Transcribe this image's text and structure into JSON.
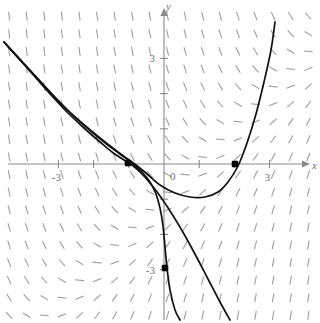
{
  "figure": {
    "title": "",
    "background_color": "#ffffff",
    "width": 320,
    "height": 323
  },
  "axes": {
    "x_label": "x",
    "y_label": "y",
    "origin_label": "0",
    "x_ticks": [
      {
        "value": -3,
        "label": "-3"
      },
      {
        "value": -2,
        "label": ""
      },
      {
        "value": -1,
        "label": ""
      },
      {
        "value": 1,
        "label": ""
      },
      {
        "value": 2,
        "label": ""
      },
      {
        "value": 3,
        "label": "3"
      }
    ],
    "y_ticks": [
      {
        "value": 3,
        "label": "3"
      },
      {
        "value": 2,
        "label": ""
      },
      {
        "value": 1,
        "label": ""
      },
      {
        "value": -1,
        "label": ""
      },
      {
        "value": -2,
        "label": ""
      },
      {
        "value": -3,
        "label": "-3"
      }
    ],
    "axis_color": "#8a8a8a",
    "tick_label_color": "#6f6f6f"
  },
  "chart_data": {
    "type": "line",
    "title": "",
    "xlabel": "x",
    "ylabel": "y",
    "xlim": [
      -4.65,
      4.45
    ],
    "ylim": [
      -4.55,
      4.65
    ],
    "grid": false,
    "legend": "none",
    "slope_field": {
      "description": "direction-field of short dashes",
      "color": "#9a9a9a",
      "dash_length": 9,
      "x_start": -4.4,
      "x_step": 0.5,
      "x_count": 18,
      "y_start": -4.3,
      "y_step": 0.5,
      "y_count": 18
    },
    "series": [
      {
        "name": "solution-curve-upper",
        "color": "#111111",
        "points_px": [
          [
            4,
            42
          ],
          [
            20,
            60
          ],
          [
            36,
            78
          ],
          [
            52,
            96
          ],
          [
            68,
            113
          ],
          [
            84,
            128
          ],
          [
            100,
            142
          ],
          [
            112,
            152
          ],
          [
            124,
            160
          ],
          [
            132,
            165
          ],
          [
            140,
            172
          ],
          [
            150,
            183
          ],
          [
            160,
            196
          ],
          [
            172,
            214
          ],
          [
            184,
            234
          ],
          [
            196,
            256
          ],
          [
            208,
            279
          ],
          [
            220,
            302
          ],
          [
            230,
            320
          ]
        ]
      },
      {
        "name": "solution-curve-through-origin-minus-three",
        "color": "#111111",
        "points_px": [
          [
            4,
            42
          ],
          [
            24,
            64
          ],
          [
            44,
            86
          ],
          [
            64,
            107
          ],
          [
            84,
            125
          ],
          [
            104,
            142
          ],
          [
            120,
            154
          ],
          [
            132,
            163
          ],
          [
            142,
            172
          ],
          [
            150,
            182
          ],
          [
            156,
            194
          ],
          [
            160,
            208
          ],
          [
            163,
            226
          ],
          [
            165,
            247
          ],
          [
            167,
            268
          ],
          [
            170,
            290
          ],
          [
            175,
            310
          ],
          [
            180,
            320
          ]
        ]
      },
      {
        "name": "solution-curve-u-shaped",
        "color": "#111111",
        "points_px": [
          [
            4,
            42
          ],
          [
            28,
            68
          ],
          [
            52,
            94
          ],
          [
            76,
            118
          ],
          [
            100,
            138
          ],
          [
            118,
            152
          ],
          [
            132,
            162
          ],
          [
            146,
            173
          ],
          [
            160,
            185
          ],
          [
            175,
            193
          ],
          [
            190,
            197
          ],
          [
            205,
            197
          ],
          [
            218,
            192
          ],
          [
            228,
            182
          ],
          [
            238,
            166
          ],
          [
            247,
            143
          ],
          [
            256,
            114
          ],
          [
            264,
            82
          ],
          [
            271,
            50
          ],
          [
            275,
            22
          ]
        ]
      }
    ],
    "marked_points": [
      {
        "label": "",
        "x_px": 128,
        "y_px": 163,
        "x": -1.02,
        "y": 0.03
      },
      {
        "label": "",
        "x_px": 235,
        "y_px": 164,
        "x": 2.03,
        "y": 0.0
      },
      {
        "label": "",
        "x_px": 165,
        "y_px": 268,
        "x": 0.03,
        "y": -2.97
      }
    ]
  },
  "geometry": {
    "origin_x_px": 164,
    "origin_y_px": 164,
    "unit_px": 35.2
  }
}
